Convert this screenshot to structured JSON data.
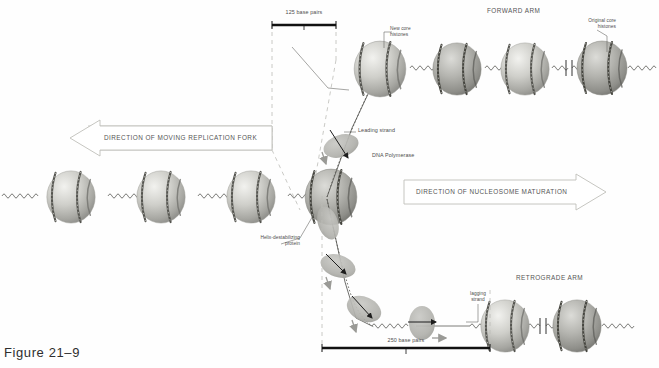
{
  "figure": {
    "caption": "Figure 21–9"
  },
  "scale_bars": [
    {
      "name": "top",
      "label": "125 base pairs"
    },
    {
      "name": "bottom",
      "label": "250 base pairs"
    }
  ],
  "direction_arrows": [
    {
      "label": "DIRECTION OF MOVING REPLICATION FORK",
      "points": "left"
    },
    {
      "label": "DIRECTION OF NUCLEOSOME MATURATION",
      "points": "right"
    }
  ],
  "arm_titles": [
    {
      "label": "FORWARD ARM"
    },
    {
      "label": "RETROGRADE ARM"
    }
  ],
  "annotations": [
    {
      "name": "new-core-histones",
      "label": "New core\nhistones"
    },
    {
      "name": "original-core-histones",
      "label": "Original core\nhistones"
    },
    {
      "name": "leading-strand",
      "label": "Leading strand"
    },
    {
      "name": "dna-polymerase",
      "label": "DNA Polymerase"
    },
    {
      "name": "helix-destabilizing-protein",
      "label": "Helix-destabilizing\nprotein"
    },
    {
      "name": "lagging-strand",
      "label": "lagging\nstrand"
    }
  ],
  "colors": {
    "background": "#fefefe",
    "ink": "#4a4a4a",
    "nucleosome_light": "#e8e8e4",
    "nucleosome_mid": "#b9b9b4",
    "nucleosome_dark": "#8d8d88",
    "polymerase_fill": "#b0b0ac",
    "dna_strand": "#6f6f6c",
    "dashed_guide": "#b5b5b0",
    "scale_bar": "#1a1a1a"
  },
  "nucleosome_rows": {
    "parent_left": {
      "count": 4,
      "x": [
        68,
        158,
        248,
        338
      ]
    },
    "forward_arm": {
      "count": 4,
      "x": [
        380,
        462,
        530,
        612
      ]
    },
    "retrograde_arm": {
      "count": 2,
      "x": [
        568,
        634
      ]
    }
  },
  "polymerases": {
    "count": 4
  }
}
